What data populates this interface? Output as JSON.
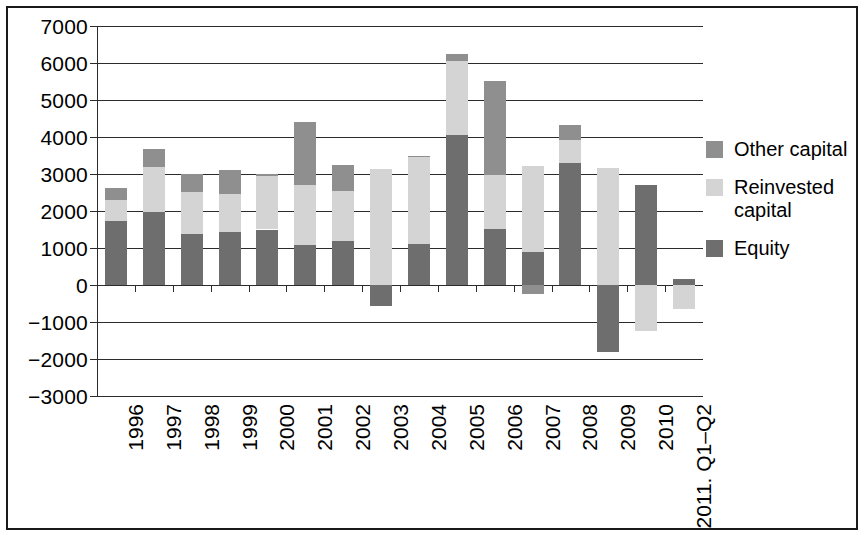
{
  "chart_data": {
    "type": "bar",
    "subtype": "stacked-bar-with-negatives",
    "title": "",
    "xlabel": "",
    "ylabel": "",
    "ylim": [
      -3000,
      7000
    ],
    "ytick_step": 1000,
    "yticks": [
      "7000",
      "6000",
      "5000",
      "4000",
      "3000",
      "2000",
      "1000",
      "0",
      "−1000",
      "−2000",
      "−3000"
    ],
    "ytick_values": [
      7000,
      6000,
      5000,
      4000,
      3000,
      2000,
      1000,
      0,
      -1000,
      -2000,
      -3000
    ],
    "grid": true,
    "grid_axis": "y",
    "legend_position": "right",
    "categories": [
      "1996",
      "1997",
      "1998",
      "1999",
      "2000",
      "2001",
      "2002",
      "2003",
      "2004",
      "2005",
      "2006",
      "2007",
      "2008",
      "2009",
      "2010",
      "2011. Q1–Q2"
    ],
    "series": [
      {
        "name": "Equity",
        "color": "#6e6e6e",
        "values": [
          1730,
          1980,
          1370,
          1440,
          1500,
          1080,
          1190,
          -580,
          1100,
          4050,
          1510,
          890,
          3300,
          -1800,
          2700,
          150
        ]
      },
      {
        "name": "Reinvested capital",
        "color": "#d4d4d4",
        "values": [
          560,
          1220,
          1140,
          1020,
          1440,
          1620,
          1340,
          3130,
          2380,
          2000,
          1460,
          2330,
          620,
          3150,
          -1250,
          -650
        ]
      },
      {
        "name": "Other capital",
        "color": "#8f8f8f",
        "values": [
          320,
          480,
          500,
          650,
          60,
          1700,
          720,
          0,
          20,
          200,
          2540,
          -250,
          400,
          0,
          0,
          0
        ]
      }
    ],
    "totals": [
      2610,
      3680,
      3010,
      3110,
      3000,
      4400,
      3250,
      2550,
      3500,
      6250,
      5510,
      2970,
      4320,
      1350,
      1450,
      -500
    ]
  },
  "legend": {
    "items": [
      {
        "label": "Other capital",
        "swatch": "other"
      },
      {
        "label": "Reinvested\ncapital",
        "swatch": "reinvested"
      },
      {
        "label": "Equity",
        "swatch": "equity"
      }
    ]
  }
}
